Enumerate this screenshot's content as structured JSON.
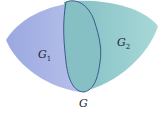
{
  "diagram": {
    "type": "set-region-overlap",
    "regions": [
      {
        "id": "G1",
        "label_main": "G",
        "label_sub": "1",
        "color": "#a9b5e6"
      },
      {
        "id": "G2",
        "label_main": "G",
        "label_sub": "2",
        "color": "#8ec8cc"
      }
    ],
    "overlap": {
      "color": "#86bfc4",
      "outline_color": "#3d5a8c"
    },
    "union_label": "G"
  }
}
